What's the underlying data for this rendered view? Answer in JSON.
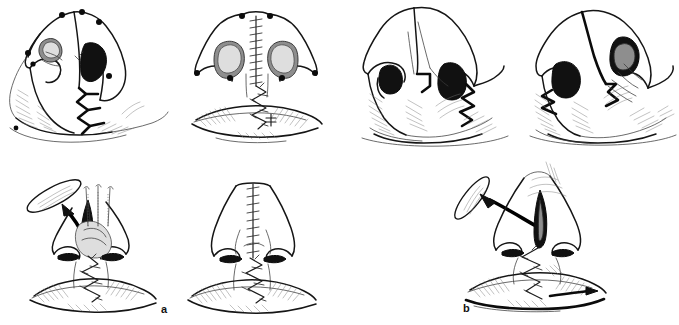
{
  "figure": {
    "type": "surgical-technique-illustration",
    "medium": "pen-and-ink line drawing",
    "background_color": "#ffffff",
    "ink_color": "#151515",
    "panel_count": 2,
    "illustration_count": 7
  },
  "panels": [
    {
      "id": "a",
      "label": "a",
      "label_style": "bold lowercase",
      "caption": "a",
      "illustrations": [
        {
          "id": "a1",
          "view": "oblique basal view",
          "stage": "markings and incisions",
          "features": [
            "marked surgical points",
            "dark nostril vestibule shading",
            "zigzag Z-plasty incision line",
            "hatched lip shading"
          ],
          "marker_points": 7
        },
        {
          "id": "a2",
          "view": "basal worm's-eye view",
          "stage": "closed with sutures",
          "features": [
            "columellar ladder suture line",
            "zigzag Z-plasty suture",
            "both nostril sills shaded",
            "hatched upper lip"
          ],
          "marker_points": 6
        },
        {
          "id": "a3",
          "view": "frontal view",
          "stage": "excision and mattress sutures",
          "features": [
            "excised tissue ellipse with arrow",
            "three vertical mattress sutures",
            "zigzag lip closure",
            "alar base marks"
          ],
          "suture_needles": 3
        },
        {
          "id": "a4",
          "view": "frontal view",
          "stage": "final closure",
          "features": [
            "vertical ladder suture line on dorsum",
            "zigzag lip suture line",
            "hatched lip shading"
          ]
        }
      ]
    },
    {
      "id": "b",
      "label": "b",
      "label_style": "bold lowercase",
      "caption": "b",
      "illustrations": [
        {
          "id": "b1",
          "view": "oblique basal view",
          "stage": "alternative flap design",
          "features": [
            "dark nostril vestibules",
            "jagged stepped incision",
            "hatched columellar base"
          ]
        },
        {
          "id": "b2",
          "view": "oblique basal view",
          "stage": "alternative closure",
          "features": [
            "dark nostril apertures",
            "stepped incision margin",
            "dense hatched lip shading"
          ]
        },
        {
          "id": "b3",
          "view": "frontal view",
          "stage": "excision and repair",
          "features": [
            "excised tissue ellipse with arrow",
            "dark shaded spindle defect",
            "zigzag lip suture line",
            "hatched lip"
          ]
        }
      ]
    }
  ]
}
